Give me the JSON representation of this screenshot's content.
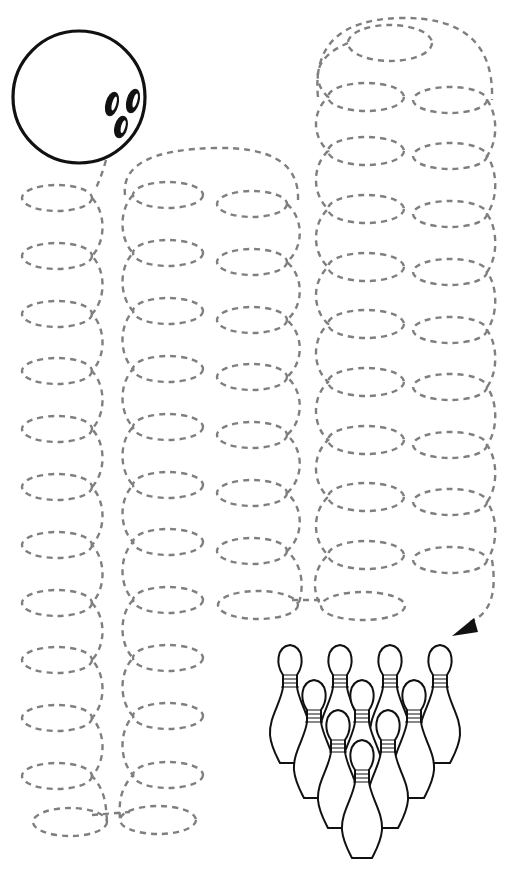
{
  "worksheet": {
    "title": "",
    "type": "tracing-path-worksheet",
    "theme": "bowling",
    "colors": {
      "background": "#ffffff",
      "trace_line": "#7f7f7f",
      "outline": "#111111"
    }
  },
  "ball": {
    "name": "bowling-ball",
    "cx": 79,
    "cy": 97,
    "r": 66,
    "finger_holes": [
      {
        "cx": 112,
        "cy": 104,
        "rx": 6,
        "ry": 12,
        "rot": 15
      },
      {
        "cx": 133,
        "cy": 101,
        "rx": 6,
        "ry": 12,
        "rot": 15
      },
      {
        "cx": 121,
        "cy": 127,
        "rx": 6,
        "ry": 11,
        "rot": 15
      }
    ]
  },
  "trace_columns": [
    {
      "name": "column-1",
      "spine_x": 100,
      "loop_side": "left",
      "loops": [
        {
          "cx": 57,
          "cy": 198,
          "rx": 35,
          "ry": 13
        },
        {
          "cx": 57,
          "cy": 256,
          "rx": 35,
          "ry": 13
        },
        {
          "cx": 57,
          "cy": 314,
          "rx": 35,
          "ry": 13
        },
        {
          "cx": 57,
          "cy": 371,
          "rx": 35,
          "ry": 13
        },
        {
          "cx": 57,
          "cy": 429,
          "rx": 35,
          "ry": 13
        },
        {
          "cx": 57,
          "cy": 487,
          "rx": 35,
          "ry": 13
        },
        {
          "cx": 57,
          "cy": 545,
          "rx": 35,
          "ry": 13
        },
        {
          "cx": 57,
          "cy": 603,
          "rx": 35,
          "ry": 13
        },
        {
          "cx": 57,
          "cy": 660,
          "rx": 35,
          "ry": 13
        },
        {
          "cx": 57,
          "cy": 718,
          "rx": 35,
          "ry": 13
        },
        {
          "cx": 57,
          "cy": 776,
          "rx": 35,
          "ry": 13
        },
        {
          "cx": 70,
          "cy": 822,
          "rx": 37,
          "ry": 14
        }
      ]
    },
    {
      "name": "column-2",
      "spine_x": 125,
      "loop_side": "right",
      "loops": [
        {
          "cx": 168,
          "cy": 195,
          "rx": 35,
          "ry": 13
        },
        {
          "cx": 168,
          "cy": 253,
          "rx": 35,
          "ry": 13
        },
        {
          "cx": 168,
          "cy": 311,
          "rx": 35,
          "ry": 13
        },
        {
          "cx": 168,
          "cy": 369,
          "rx": 35,
          "ry": 13
        },
        {
          "cx": 168,
          "cy": 427,
          "rx": 35,
          "ry": 13
        },
        {
          "cx": 168,
          "cy": 485,
          "rx": 35,
          "ry": 13
        },
        {
          "cx": 168,
          "cy": 542,
          "rx": 35,
          "ry": 13
        },
        {
          "cx": 168,
          "cy": 600,
          "rx": 35,
          "ry": 13
        },
        {
          "cx": 168,
          "cy": 658,
          "rx": 35,
          "ry": 13
        },
        {
          "cx": 168,
          "cy": 716,
          "rx": 35,
          "ry": 13
        },
        {
          "cx": 168,
          "cy": 775,
          "rx": 35,
          "ry": 13
        },
        {
          "cx": 158,
          "cy": 820,
          "rx": 38,
          "ry": 14
        }
      ]
    },
    {
      "name": "column-3",
      "spine_x": 298,
      "loop_side": "left",
      "loops": [
        {
          "cx": 252,
          "cy": 204,
          "rx": 35,
          "ry": 13
        },
        {
          "cx": 252,
          "cy": 262,
          "rx": 35,
          "ry": 13
        },
        {
          "cx": 252,
          "cy": 320,
          "rx": 35,
          "ry": 13
        },
        {
          "cx": 252,
          "cy": 377,
          "rx": 35,
          "ry": 13
        },
        {
          "cx": 252,
          "cy": 435,
          "rx": 35,
          "ry": 13
        },
        {
          "cx": 252,
          "cy": 493,
          "rx": 35,
          "ry": 13
        },
        {
          "cx": 252,
          "cy": 551,
          "rx": 35,
          "ry": 13
        },
        {
          "cx": 258,
          "cy": 605,
          "rx": 40,
          "ry": 14
        }
      ]
    },
    {
      "name": "column-4",
      "spine_x": 318,
      "loop_side": "right",
      "loops": [
        {
          "cx": 390,
          "cy": 43,
          "rx": 42,
          "ry": 18
        },
        {
          "cx": 366,
          "cy": 97,
          "rx": 38,
          "ry": 14
        },
        {
          "cx": 366,
          "cy": 151,
          "rx": 38,
          "ry": 14
        },
        {
          "cx": 366,
          "cy": 209,
          "rx": 38,
          "ry": 14
        },
        {
          "cx": 366,
          "cy": 267,
          "rx": 38,
          "ry": 14
        },
        {
          "cx": 366,
          "cy": 324,
          "rx": 38,
          "ry": 14
        },
        {
          "cx": 366,
          "cy": 382,
          "rx": 38,
          "ry": 14
        },
        {
          "cx": 366,
          "cy": 440,
          "rx": 38,
          "ry": 14
        },
        {
          "cx": 366,
          "cy": 497,
          "rx": 38,
          "ry": 14
        },
        {
          "cx": 366,
          "cy": 555,
          "rx": 38,
          "ry": 14
        },
        {
          "cx": 363,
          "cy": 606,
          "rx": 42,
          "ry": 14
        }
      ]
    },
    {
      "name": "column-5",
      "spine_x": 492,
      "loop_side": "left",
      "loops": [
        {
          "cx": 450,
          "cy": 100,
          "rx": 37,
          "ry": 13
        },
        {
          "cx": 450,
          "cy": 156,
          "rx": 37,
          "ry": 13
        },
        {
          "cx": 450,
          "cy": 214,
          "rx": 37,
          "ry": 13
        },
        {
          "cx": 450,
          "cy": 272,
          "rx": 37,
          "ry": 13
        },
        {
          "cx": 450,
          "cy": 330,
          "rx": 37,
          "ry": 13
        },
        {
          "cx": 450,
          "cy": 387,
          "rx": 37,
          "ry": 13
        },
        {
          "cx": 450,
          "cy": 445,
          "rx": 37,
          "ry": 13
        },
        {
          "cx": 450,
          "cy": 502,
          "rx": 37,
          "ry": 13
        },
        {
          "cx": 450,
          "cy": 560,
          "rx": 37,
          "ry": 13
        }
      ]
    }
  ],
  "connectors": [
    {
      "name": "ball-to-column-1",
      "d": "M 106 160 Q 102 175 96 188"
    },
    {
      "name": "column-2-top-arch",
      "d": "M 125 195 Q 120 150 215 148 Q 300 146 298 200"
    },
    {
      "name": "column-4-top-arch",
      "d": "M 318 97 Q 310 20 400 18 Q 495 16 492 100"
    },
    {
      "name": "bottom-1-2-bridge",
      "d": "M 92 815 L 130 812"
    },
    {
      "name": "bottom-3-4-bridge",
      "d": "M 292 600 L 325 600"
    },
    {
      "name": "column-5-to-arrow",
      "d": "M 492 560 Q 500 610 470 622"
    }
  ],
  "arrow": {
    "name": "arrow-to-pins",
    "points": "452,636 474,618 478,632"
  },
  "pins": {
    "count": 10,
    "items": [
      {
        "x": 290,
        "y": 645
      },
      {
        "x": 340,
        "y": 645
      },
      {
        "x": 390,
        "y": 645
      },
      {
        "x": 440,
        "y": 645
      },
      {
        "x": 314,
        "y": 680
      },
      {
        "x": 362,
        "y": 680
      },
      {
        "x": 414,
        "y": 680
      },
      {
        "x": 338,
        "y": 710
      },
      {
        "x": 388,
        "y": 710
      },
      {
        "x": 362,
        "y": 740
      }
    ]
  }
}
